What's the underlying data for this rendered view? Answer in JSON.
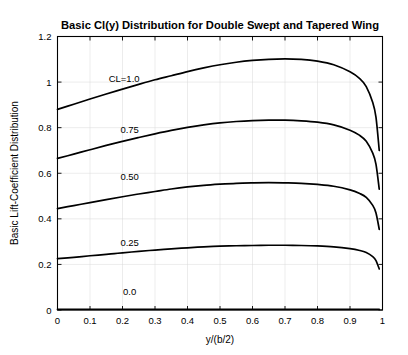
{
  "chart_data": {
    "type": "line",
    "title": "Basic Cl(y) Distribution for Double Swept and Tapered Wing",
    "xlabel": "y/(b/2)",
    "ylabel": "Basic Lift-Coefficient Distribution",
    "xlim": [
      0,
      1
    ],
    "ylim": [
      0,
      1.2
    ],
    "xticks": [
      "0",
      "0.1",
      "0.2",
      "0.3",
      "0.4",
      "0.5",
      "0.6",
      "0.7",
      "0.8",
      "0.9",
      "1"
    ],
    "xtick_values": [
      0,
      0.1,
      0.2,
      0.3,
      0.4,
      0.5,
      0.6,
      0.7,
      0.8,
      0.9,
      1
    ],
    "yticks": [
      "0",
      "0.2",
      "0.4",
      "0.6",
      "0.8",
      "1",
      "1.2"
    ],
    "ytick_values": [
      0,
      0.2,
      0.4,
      0.6,
      0.8,
      1,
      1.2
    ],
    "grid": true,
    "legend_position": "inline-curve-labels",
    "x": [
      0,
      0.05,
      0.1,
      0.15,
      0.2,
      0.25,
      0.3,
      0.35,
      0.4,
      0.45,
      0.5,
      0.55,
      0.6,
      0.65,
      0.7,
      0.75,
      0.8,
      0.85,
      0.9,
      0.93,
      0.95,
      0.97,
      0.98,
      0.99
    ],
    "series": [
      {
        "name": "CL=1.0",
        "label": "CL=1.0",
        "label_x": 0.205,
        "label_y": 1.015,
        "values": [
          0.88,
          0.903,
          0.926,
          0.948,
          0.969,
          0.99,
          1.01,
          1.028,
          1.046,
          1.062,
          1.076,
          1.087,
          1.095,
          1.1,
          1.102,
          1.1,
          1.092,
          1.076,
          1.045,
          1.015,
          0.98,
          0.91,
          0.845,
          0.7
        ]
      },
      {
        "name": "0.75",
        "label": "0.75",
        "label_x": 0.222,
        "label_y": 0.79,
        "values": [
          0.665,
          0.684,
          0.703,
          0.722,
          0.74,
          0.757,
          0.773,
          0.788,
          0.801,
          0.812,
          0.821,
          0.827,
          0.831,
          0.833,
          0.833,
          0.83,
          0.824,
          0.812,
          0.789,
          0.766,
          0.74,
          0.688,
          0.639,
          0.53
        ]
      },
      {
        "name": "0.50",
        "label": "0.50",
        "label_x": 0.222,
        "label_y": 0.585,
        "values": [
          0.445,
          0.458,
          0.471,
          0.484,
          0.497,
          0.509,
          0.52,
          0.531,
          0.54,
          0.547,
          0.552,
          0.556,
          0.558,
          0.559,
          0.558,
          0.556,
          0.551,
          0.543,
          0.527,
          0.511,
          0.494,
          0.459,
          0.426,
          0.354
        ]
      },
      {
        "name": "0.25",
        "label": "0.25",
        "label_x": 0.222,
        "label_y": 0.295,
        "values": [
          0.225,
          0.231,
          0.238,
          0.244,
          0.251,
          0.257,
          0.263,
          0.268,
          0.273,
          0.277,
          0.28,
          0.282,
          0.283,
          0.284,
          0.284,
          0.283,
          0.281,
          0.277,
          0.269,
          0.261,
          0.252,
          0.234,
          0.217,
          0.18
        ]
      },
      {
        "name": "0.0",
        "label": "0.0",
        "label_x": 0.222,
        "label_y": 0.082,
        "values": [
          0.003,
          0.003,
          0.003,
          0.003,
          0.003,
          0.003,
          0.003,
          0.003,
          0.003,
          0.003,
          0.003,
          0.003,
          0.003,
          0.003,
          0.003,
          0.003,
          0.003,
          0.003,
          0.003,
          0.003,
          0.003,
          0.003,
          0.003,
          0.003
        ]
      }
    ],
    "colors": {
      "curve": "#000000",
      "axis": "#000000",
      "grid": "#d8d8d8",
      "background": "#ffffff"
    }
  }
}
